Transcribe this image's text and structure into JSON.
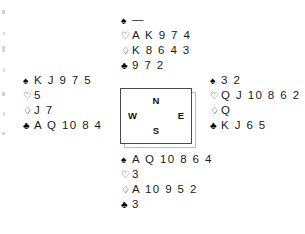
{
  "diagram": {
    "type": "bridge-deal",
    "background_color": "#ffffff",
    "text_color": "#1a1a1a"
  },
  "compass": {
    "north_label": "N",
    "west_label": "W",
    "east_label": "E",
    "south_label": "S",
    "border_color": "#4a4a4a",
    "shadow_color": "#b9b9b9"
  },
  "suits": {
    "spade_pip": "♠",
    "heart_pip": "♡",
    "diamond_pip": "♢",
    "club_pip": "♣",
    "void_mark": "—"
  },
  "hands": {
    "north": {
      "position_label": "North",
      "spades": "—",
      "hearts": "A K 9 7 4",
      "diamonds": "K 8 6 4 3",
      "clubs": "9 7 2"
    },
    "west": {
      "position_label": "West",
      "spades": "K J 9 7 5",
      "hearts": "5",
      "diamonds": "J 7",
      "clubs": "A Q 10 8 4"
    },
    "east": {
      "position_label": "East",
      "spades": "3 2",
      "hearts": "Q J 10 8 6 2",
      "diamonds": "Q",
      "clubs": "K J 6 5"
    },
    "south": {
      "position_label": "South",
      "spades": "A Q 10 8 6 4",
      "hearts": "3",
      "diamonds": "A 10 9 5 2",
      "clubs": "3"
    }
  }
}
